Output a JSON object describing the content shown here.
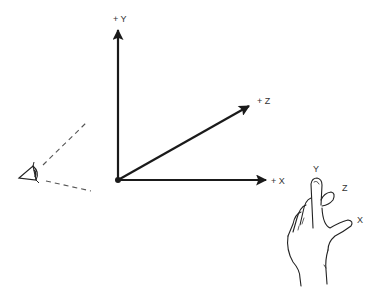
{
  "diagram": {
    "type": "3d-coordinate-system-left-hand-rule",
    "axes": [
      {
        "name": "y",
        "label": "+ Y",
        "direction": "up"
      },
      {
        "name": "z",
        "label": "+ Z",
        "direction": "into-screen (diagonal up-right)"
      },
      {
        "name": "x",
        "label": "+ X",
        "direction": "right"
      }
    ],
    "viewer": {
      "icon": "eye-icon",
      "description": "viewpoint looking toward origin with dashed field-of-view lines"
    },
    "hand": {
      "description": "left hand illustrating axis orientation",
      "finger_labels": {
        "y": "Y",
        "z": "Z",
        "x": "X"
      }
    }
  },
  "colors": {
    "axis": "#1a1a1a",
    "label": "#333333",
    "dashed": "#555555",
    "background": "#ffffff"
  }
}
